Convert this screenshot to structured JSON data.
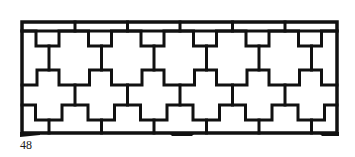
{
  "figure": {
    "caption_number": "48",
    "colors": {
      "stroke": "#111111",
      "background": "#ffffff"
    },
    "geometry": {
      "frame": {
        "x1": 22,
        "y1": 22,
        "x2": 337,
        "y2": 133
      },
      "period": 52.5,
      "a_columns_start": 49,
      "b_columns_start": 75,
      "top_rail_y": 31,
      "band1": {
        "low": 31,
        "high": 46,
        "half_left": 13,
        "half_right": 10
      },
      "band2": {
        "up": 70,
        "down": 85,
        "half_left": 12,
        "half_right": 10
      },
      "band3": {
        "up": 105,
        "down": 120,
        "half": 13
      }
    }
  }
}
